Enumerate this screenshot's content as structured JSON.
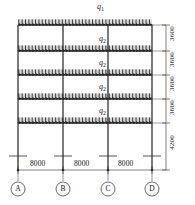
{
  "diagram": {
    "line_color": "#2b2b2b",
    "load_color": "#1a1a1a",
    "background": "#ffffff",
    "loads": {
      "roof": {
        "symbol": "q",
        "subscript": "1"
      },
      "floor": {
        "symbol": "q",
        "subscript": "2"
      },
      "floor_labels": [
        {
          "symbol": "q",
          "subscript": "2"
        },
        {
          "symbol": "q",
          "subscript": "2"
        },
        {
          "symbol": "q",
          "subscript": "2"
        },
        {
          "symbol": "q",
          "subscript": "2"
        }
      ]
    },
    "spans": {
      "unit": "mm",
      "values": [
        "8000",
        "8000",
        "8000"
      ]
    },
    "story_heights": {
      "unit": "mm",
      "values": [
        "3600",
        "3600",
        "3600",
        "3600",
        "4200"
      ]
    },
    "grid_labels": [
      "A",
      "B",
      "C",
      "D"
    ],
    "geometry": {
      "columns_x": [
        18,
        63,
        108,
        152
      ],
      "beams_y": [
        25,
        51,
        75,
        99,
        123
      ],
      "base_y": 170,
      "dim_line_x": 166,
      "span_line_y": 170
    }
  }
}
